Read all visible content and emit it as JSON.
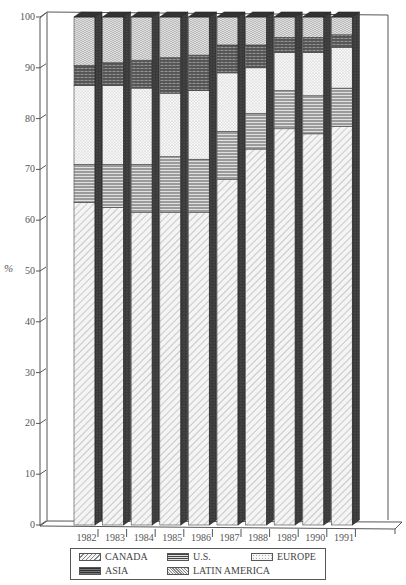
{
  "chart_data": {
    "type": "bar",
    "stacked": true,
    "style": "3d",
    "title": "",
    "xlabel": "",
    "ylabel": "%",
    "ylim": [
      0,
      100
    ],
    "yticks": [
      0,
      10,
      20,
      30,
      40,
      50,
      60,
      70,
      80,
      90,
      100
    ],
    "categories": [
      "1982",
      "1983",
      "1984",
      "1985",
      "1986",
      "1987",
      "1988",
      "1989",
      "1990",
      "1991"
    ],
    "series": [
      {
        "name": "CANADA",
        "pattern": "diagonal-hatch",
        "values": [
          63.5,
          62.5,
          61.5,
          61.5,
          61.5,
          68.0,
          74.0,
          78.0,
          77.0,
          78.5
        ]
      },
      {
        "name": "U.S.",
        "pattern": "horizontal-lines",
        "values": [
          7.5,
          8.5,
          9.5,
          11.0,
          10.5,
          9.5,
          7.0,
          7.5,
          7.5,
          7.5
        ]
      },
      {
        "name": "EUROPE",
        "pattern": "light-dots",
        "values": [
          15.5,
          15.5,
          15.0,
          12.5,
          13.5,
          11.5,
          9.0,
          7.5,
          8.5,
          8.0
        ]
      },
      {
        "name": "ASIA",
        "pattern": "dark-brick",
        "values": [
          4.0,
          4.5,
          5.5,
          7.0,
          7.0,
          5.5,
          4.5,
          3.0,
          3.0,
          2.5
        ]
      },
      {
        "name": "LATIN AMERICA",
        "pattern": "wave-check",
        "values": [
          9.5,
          9.0,
          8.5,
          8.0,
          7.5,
          5.5,
          5.5,
          4.0,
          4.0,
          3.5
        ]
      }
    ],
    "legend_position": "bottom",
    "grid": false
  },
  "legend": {
    "items": [
      {
        "label": "CANADA"
      },
      {
        "label": "U.S."
      },
      {
        "label": "EUROPE"
      },
      {
        "label": "ASIA"
      },
      {
        "label": "LATIN AMERICA"
      }
    ]
  },
  "axis": {
    "ylabel": "%"
  }
}
